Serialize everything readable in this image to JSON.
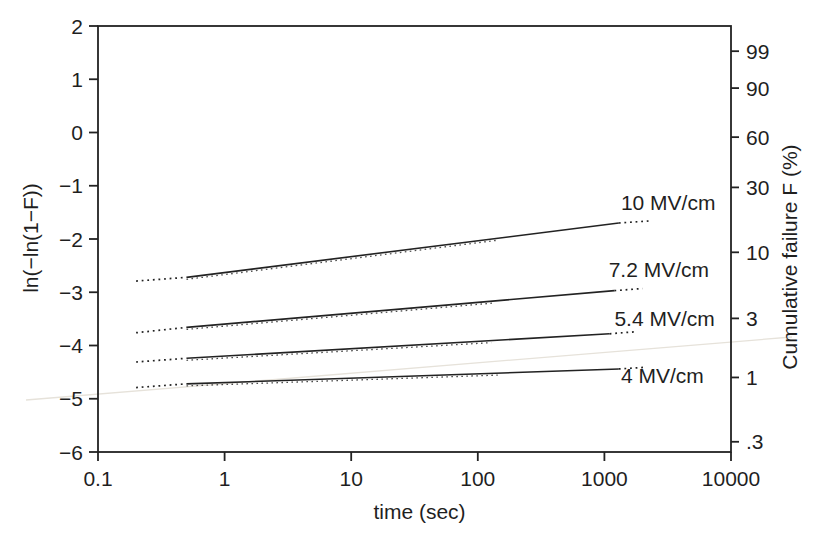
{
  "figure": {
    "kind": "scanned-book-weibull-plot",
    "background": "#ffffff",
    "ink": "#222222",
    "artifact_color": "#e6e2da"
  },
  "chart_data": {
    "type": "line",
    "title": "",
    "xlabel": "time (sec)",
    "ylabel": "ln(−ln(1−F))",
    "ylabel_right": "Cumulative failure F (%)",
    "x_scale": "log",
    "y_scale": "linear",
    "xlim": [
      0.1,
      10000
    ],
    "ylim": [
      -6,
      2
    ],
    "grid": false,
    "legend": "inline-labels",
    "x_ticks": [
      {
        "t": 0.1,
        "label": "0.1"
      },
      {
        "t": 1,
        "label": "1"
      },
      {
        "t": 10,
        "label": "10"
      },
      {
        "t": 100,
        "label": "100"
      },
      {
        "t": 1000,
        "label": "1000"
      },
      {
        "t": 10000,
        "label": "10000"
      }
    ],
    "y_ticks_left": [
      {
        "v": 2,
        "label": "2"
      },
      {
        "v": 1,
        "label": "1"
      },
      {
        "v": 0,
        "label": "0"
      },
      {
        "v": -1,
        "label": "−1"
      },
      {
        "v": -2,
        "label": "−2"
      },
      {
        "v": -3,
        "label": "−3"
      },
      {
        "v": -4,
        "label": "−4"
      },
      {
        "v": -5,
        "label": "−5"
      },
      {
        "v": -6,
        "label": "−6"
      }
    ],
    "y_ticks_right": [
      {
        "v": 1.527,
        "label": "99",
        "percent": 99
      },
      {
        "v": 0.834,
        "label": "90",
        "percent": 90
      },
      {
        "v": -0.087,
        "label": "60",
        "percent": 60
      },
      {
        "v": -1.031,
        "label": "30",
        "percent": 30
      },
      {
        "v": -2.25,
        "label": "10",
        "percent": 10
      },
      {
        "v": -3.491,
        "label": "3",
        "percent": 3
      },
      {
        "v": -4.6,
        "label": "1",
        "percent": 1
      },
      {
        "v": -5.808,
        "label": ".3",
        "percent": 0.3
      }
    ],
    "series": [
      {
        "name": "10 MV/cm",
        "label": {
          "text": "10 MV/cm",
          "t": 1350,
          "v": -1.32
        },
        "segments": [
          {
            "style": "dotted",
            "points": [
              [
                0.2,
                -2.79
              ],
              [
                0.5,
                -2.72
              ]
            ]
          },
          {
            "style": "solid",
            "points": [
              [
                0.5,
                -2.72
              ],
              [
                1300,
                -1.7
              ]
            ]
          },
          {
            "style": "dotted",
            "points": [
              [
                1300,
                -1.7
              ],
              [
                2300,
                -1.66
              ]
            ]
          }
        ]
      },
      {
        "name": "7.2 MV/cm",
        "label": {
          "text": "7.2 MV/cm",
          "t": 1080,
          "v": -2.58
        },
        "segments": [
          {
            "style": "dotted",
            "points": [
              [
                0.2,
                -3.76
              ],
              [
                0.5,
                -3.66
              ]
            ]
          },
          {
            "style": "solid",
            "points": [
              [
                0.5,
                -3.66
              ],
              [
                1200,
                -2.97
              ]
            ]
          },
          {
            "style": "dotted",
            "points": [
              [
                1200,
                -2.97
              ],
              [
                2000,
                -2.93
              ]
            ]
          }
        ]
      },
      {
        "name": "5.4 MV/cm",
        "label": {
          "text": "5.4 MV/cm",
          "t": 1200,
          "v": -3.49
        },
        "segments": [
          {
            "style": "dotted",
            "points": [
              [
                0.2,
                -4.31
              ],
              [
                0.5,
                -4.24
              ]
            ]
          },
          {
            "style": "solid",
            "points": [
              [
                0.5,
                -4.24
              ],
              [
                1100,
                -3.78
              ]
            ]
          },
          {
            "style": "dotted",
            "points": [
              [
                1100,
                -3.78
              ],
              [
                1800,
                -3.74
              ]
            ]
          }
        ]
      },
      {
        "name": "4 MV/cm",
        "label": {
          "text": "4 MV/cm",
          "t": 1350,
          "v": -4.56
        },
        "segments": [
          {
            "style": "dotted",
            "points": [
              [
                0.2,
                -4.79
              ],
              [
                0.5,
                -4.72
              ]
            ]
          },
          {
            "style": "solid",
            "points": [
              [
                0.5,
                -4.72
              ],
              [
                1300,
                -4.44
              ]
            ]
          },
          {
            "style": "dotted",
            "points": [
              [
                1300,
                -4.44
              ],
              [
                2100,
                -4.41
              ]
            ]
          }
        ]
      }
    ]
  }
}
